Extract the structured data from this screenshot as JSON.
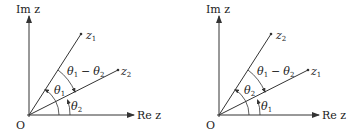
{
  "figures": [
    {
      "id": "left",
      "axis_labels": {
        "imag": "Im z",
        "real": "Re z",
        "origin": "O"
      },
      "vectors": [
        {
          "name": "z",
          "sub": "1",
          "label": "z1"
        },
        {
          "name": "z",
          "sub": "2",
          "label": "z2"
        }
      ],
      "angles": {
        "large": {
          "theta": "θ",
          "sub": "1",
          "label": "θ1"
        },
        "small": {
          "theta": "θ",
          "sub": "2",
          "label": "θ2"
        },
        "difference": {
          "a": "θ",
          "a_sub": "1",
          "op": "−",
          "b": "θ",
          "b_sub": "2",
          "label": "θ1 − θ2"
        }
      }
    },
    {
      "id": "right",
      "axis_labels": {
        "imag": "Im z",
        "real": "Re z",
        "origin": "O"
      },
      "vectors": [
        {
          "name": "z",
          "sub": "2",
          "label": "z2"
        },
        {
          "name": "z",
          "sub": "1",
          "label": "z1"
        }
      ],
      "angles": {
        "large": {
          "theta": "θ",
          "sub": "2",
          "label": "θ2"
        },
        "small": {
          "theta": "θ",
          "sub": "1",
          "label": "θ1"
        },
        "difference": {
          "a": "θ",
          "a_sub": "1",
          "op": "−",
          "b": "θ",
          "b_sub": "2",
          "label": "θ1 − θ2"
        }
      }
    }
  ],
  "colors": {
    "line": "#333333",
    "text": "#222222",
    "background": "#ffffff"
  }
}
